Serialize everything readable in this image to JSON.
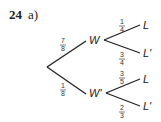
{
  "question": {
    "number": "24",
    "part": "a)"
  },
  "tree": {
    "root_branches": [
      {
        "label": "W",
        "probability": {
          "num": "7",
          "den": "8"
        }
      },
      {
        "label": "W'",
        "probability": {
          "num": "1",
          "den": "8"
        }
      }
    ],
    "w_branches": [
      {
        "label": "L",
        "probability": {
          "num": "1",
          "den": "4"
        }
      },
      {
        "label": "L'",
        "probability": {
          "num": "3",
          "den": "4"
        }
      }
    ],
    "wp_branches": [
      {
        "label": "L",
        "probability": {
          "num": "3",
          "den": "5"
        }
      },
      {
        "label": "L'",
        "probability": {
          "num": "2",
          "den": "3"
        }
      }
    ]
  },
  "colors": {
    "line": "#222222"
  }
}
